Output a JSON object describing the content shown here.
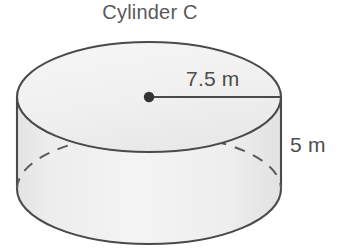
{
  "figure": {
    "kind": "cylinder-diagram",
    "title": "Cylinder C",
    "radius_label": "7.5 m",
    "height_label": "5 m",
    "colors": {
      "stroke": "#4a4a4a",
      "top_face_fill": "#f2f2f2",
      "body_fill": "#ececec",
      "text": "#545454",
      "center_dot": "#333333",
      "background": "#ffffff"
    },
    "geometry": {
      "top_ellipse_center_x": 149,
      "top_ellipse_center_y": 97,
      "ellipse_rx": 132,
      "ellipse_ry": 55,
      "bottom_ellipse_center_y": 189,
      "side_height": 92,
      "radius_line_from_x": 149,
      "radius_line_to_x": 281,
      "radius_line_y": 97,
      "center_dot_radius": 5
    }
  }
}
